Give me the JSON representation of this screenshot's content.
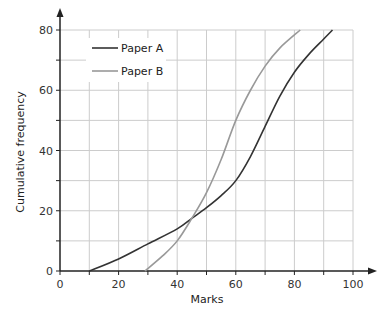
{
  "chart_data": {
    "type": "line",
    "title": "",
    "xlabel": "Marks",
    "ylabel": "Cumulative frequency",
    "xlim": [
      0,
      100
    ],
    "ylim": [
      0,
      80
    ],
    "x_ticks": [
      0,
      20,
      40,
      60,
      80,
      100
    ],
    "y_ticks": [
      0,
      20,
      40,
      60,
      80
    ],
    "x_grid_step": 10,
    "y_grid_step": 10,
    "grid": true,
    "legend_position": "upper-left",
    "series": [
      {
        "name": "Paper A",
        "color": "#333333",
        "points": [
          [
            10,
            0
          ],
          [
            20,
            4
          ],
          [
            30,
            9
          ],
          [
            40,
            14
          ],
          [
            45,
            17.5
          ],
          [
            50,
            21
          ],
          [
            55,
            25
          ],
          [
            60,
            30
          ],
          [
            65,
            38
          ],
          [
            70,
            48
          ],
          [
            75,
            58
          ],
          [
            80,
            66
          ],
          [
            85,
            72
          ],
          [
            90,
            77
          ],
          [
            93,
            80
          ]
        ]
      },
      {
        "name": "Paper B",
        "color": "#999999",
        "points": [
          [
            29,
            0
          ],
          [
            35,
            5
          ],
          [
            40,
            10
          ],
          [
            45,
            17.5
          ],
          [
            50,
            26
          ],
          [
            55,
            37
          ],
          [
            60,
            50
          ],
          [
            65,
            60
          ],
          [
            70,
            68
          ],
          [
            75,
            74
          ],
          [
            82,
            80
          ]
        ]
      }
    ]
  },
  "style": {
    "grid_color": "#cccccc",
    "axis_color": "#222222",
    "background": "#ffffff"
  }
}
